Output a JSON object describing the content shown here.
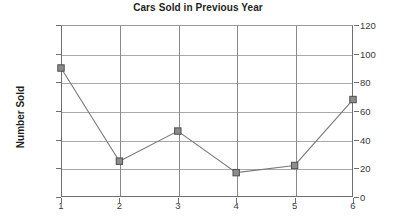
{
  "chart_data": {
    "type": "line",
    "title": "Cars Sold in Previous Year",
    "xlabel": "",
    "ylabel": "Number Sold",
    "categories": [
      "1",
      "2",
      "3",
      "4",
      "5",
      "6"
    ],
    "values": [
      90,
      25,
      46,
      17,
      22,
      68
    ],
    "ylim": [
      0,
      120
    ],
    "yticks": [
      "0",
      "20",
      "40",
      "60",
      "80",
      "100",
      "120"
    ],
    "ytick_values": [
      0,
      20,
      40,
      60,
      80,
      100,
      120
    ],
    "right_axis": {
      "visible": true,
      "ylim": [
        0,
        120
      ],
      "yticks": [
        "0",
        "20",
        "40",
        "60",
        "80",
        "100",
        "120"
      ]
    },
    "grid": {
      "horizontal": true,
      "vertical": true
    },
    "legend": {
      "visible": false,
      "position": "none"
    },
    "series": [
      {
        "name": "Number Sold",
        "values": [
          90,
          25,
          46,
          17,
          22,
          68
        ],
        "marker": "square",
        "color": "#7a7a7a"
      }
    ],
    "colors": {
      "line": "#7a7a7a",
      "marker_fill": "#8c8c8c",
      "marker_stroke": "#4d4d4d",
      "gridline": "#a9a9a9",
      "axis": "#6e6e6e",
      "text": "#231f20",
      "background": "#ffffff"
    }
  }
}
